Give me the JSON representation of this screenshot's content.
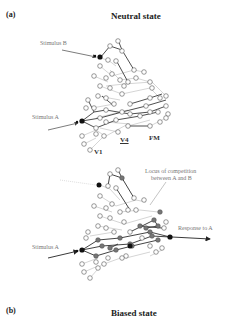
{
  "figure": {
    "panel_a": {
      "label": "(a)",
      "title": "Neutral state",
      "annotations": {
        "stimulus_b": "Stimulus B",
        "stimulus_a": "Stimulus A",
        "v1": "V1",
        "v4": "V4",
        "fm": "FM"
      }
    },
    "panel_b": {
      "label": "(b)",
      "title": "Biased state",
      "annotations": {
        "locus_line1": "Locus of competition",
        "locus_line2": "between A and B",
        "stimulus_a": "Stimulus A",
        "response": "Response to A"
      }
    },
    "colors": {
      "open_node_stroke": "#555555",
      "active_node_fill": "#777777",
      "input_node_fill": "#111111",
      "strong_edge": "#222222",
      "weak_edge": "#aaaaaa",
      "text": "#222222",
      "annotation_text": "#777777"
    }
  }
}
